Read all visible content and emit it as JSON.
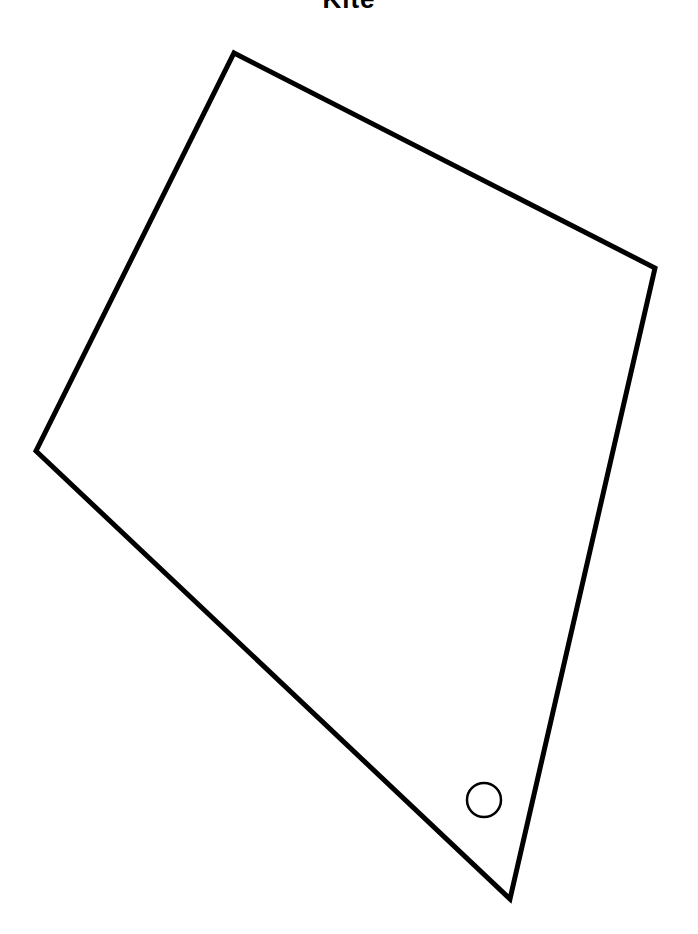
{
  "title": "Kite",
  "shape": {
    "type": "kite",
    "vertices": [
      {
        "name": "top",
        "x": 234,
        "y": 53
      },
      {
        "name": "right",
        "x": 655,
        "y": 268
      },
      {
        "name": "bottom",
        "x": 510,
        "y": 899
      },
      {
        "name": "left",
        "x": 36,
        "y": 451
      }
    ],
    "stroke": "#000000",
    "stroke_width": 5,
    "fill": "#ffffff"
  },
  "marker": {
    "type": "circle",
    "cx": 484,
    "cy": 800,
    "r": 17,
    "stroke": "#000000",
    "stroke_width": 2.5
  }
}
